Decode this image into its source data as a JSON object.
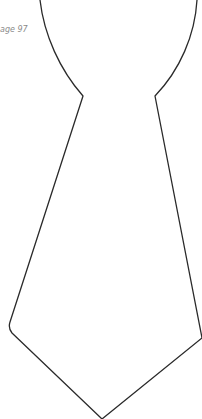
{
  "page": {
    "caption": "age 97",
    "outline_color": "#2a2a2a",
    "shape": "necktie-outline-template"
  }
}
